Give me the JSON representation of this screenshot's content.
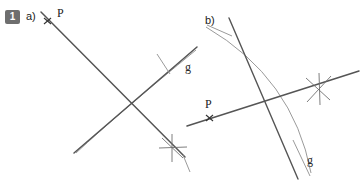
{
  "figure": {
    "background_color": "#ffffff",
    "line_color": "#555555",
    "arc_color": "#8a8a8a",
    "tick_color": "#6a6a6a",
    "text_color": "#1c1c1c",
    "badge_color": "#6e6e6e",
    "badge_text_color": "#ffffff",
    "width": 361,
    "height": 181
  },
  "exercise": {
    "number": "1"
  },
  "panels": [
    {
      "id": "a",
      "label": "a)",
      "label_x": 26,
      "label_y": 12,
      "point_label": "P",
      "point_label_x": 57,
      "point_label_y": 17,
      "line_label": "g",
      "line_label_x": 185,
      "line_label_y": 71,
      "description": "Punkt P liegt auf der Geraden; Lot durch P auf g konstruiert mit Zirkelbogen und Hilfskreuz"
    },
    {
      "id": "b",
      "label": "b)",
      "label_x": 205,
      "label_y": 18,
      "point_label": "P",
      "point_label_x": 205,
      "point_label_y": 106,
      "line_label": "g",
      "line_label_x": 307,
      "line_label_y": 163,
      "description": "Punkt P liegt auf der Geraden g; Lot durch P konstruiert mit Zirkelbogen und Hilfskreuz"
    }
  ],
  "geometry": {
    "panel_a": {
      "line_through_p": {
        "x1": 42,
        "y1": 13,
        "x2": 184,
        "y2": 156
      },
      "line_g": {
        "x1": 74,
        "y1": 152,
        "x2": 196,
        "y2": 48
      },
      "arc": {
        "start_x": 196,
        "start_y": 50,
        "ctrl_x": 120,
        "ctrl_y": 112,
        "end_x": 76,
        "end_y": 153
      },
      "point_p": {
        "x": 47,
        "y": 21
      },
      "star_marker": {
        "x": 172,
        "y": 148
      },
      "cross_marker": {
        "x": 163,
        "y": 63
      }
    },
    "panel_b": {
      "line_through_p": {
        "x1": 188,
        "y1": 125,
        "x2": 358,
        "y2": 72
      },
      "line_g": {
        "x1": 229,
        "y1": 19,
        "x2": 297,
        "y2": 178
      },
      "arc": {
        "start_x": 206,
        "start_y": 26,
        "ctrl_x": 290,
        "ctrl_y": 80,
        "end_x": 310,
        "end_y": 173
      },
      "point_p": {
        "x": 209,
        "y": 118
      },
      "star_marker": {
        "x": 320,
        "y": 89
      },
      "cross_marker": {
        "x": 239,
        "y": 31
      }
    }
  }
}
